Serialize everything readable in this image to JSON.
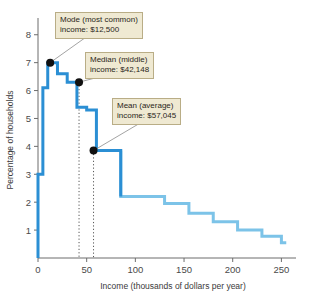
{
  "chart_data": {
    "type": "area",
    "title": "",
    "xlabel": "Income (thousands of dollars per year)",
    "ylabel": "Percentage of households",
    "xlim": [
      0,
      265
    ],
    "ylim": [
      0,
      8.6
    ],
    "xticks": [
      0,
      50,
      100,
      150,
      200,
      250
    ],
    "xtick_labels": [
      "0",
      "50",
      "100",
      "150",
      "200",
      "250"
    ],
    "yticks": [
      1,
      2,
      3,
      4,
      5,
      6,
      7,
      8
    ],
    "ytick_labels": [
      "1",
      "2",
      "3",
      "4",
      "5",
      "6",
      "7",
      "8"
    ],
    "grid": false,
    "legend": "none",
    "bin_width": 5,
    "bin_starts": [
      0,
      5,
      10,
      15,
      20,
      25,
      30,
      35,
      40,
      45,
      50,
      55,
      60,
      65,
      70,
      75,
      80,
      85,
      90,
      95,
      100,
      105,
      110,
      115,
      120,
      125,
      130,
      135,
      140,
      145,
      150,
      155,
      160,
      165,
      170,
      175,
      180,
      185,
      190,
      195,
      200,
      205,
      210,
      215,
      220,
      225,
      230,
      235,
      240,
      245,
      250
    ],
    "values": [
      3.0,
      6.1,
      7.0,
      7.0,
      6.6,
      6.6,
      6.3,
      6.3,
      5.4,
      5.4,
      5.3,
      5.3,
      3.85,
      3.85,
      3.85,
      3.85,
      3.85,
      2.2,
      2.2,
      2.2,
      2.2,
      2.2,
      2.2,
      2.2,
      2.2,
      2.2,
      1.95,
      1.95,
      1.95,
      1.95,
      1.95,
      1.6,
      1.6,
      1.6,
      1.6,
      1.6,
      1.3,
      1.3,
      1.3,
      1.3,
      1.3,
      1.0,
      1.0,
      1.0,
      1.0,
      1.0,
      0.78,
      0.78,
      0.78,
      0.78,
      0.55
    ],
    "markers": [
      {
        "name": "mode",
        "x": 12.5,
        "y": 7.0,
        "label": "Mode (most common)",
        "value_label": "income: $12,500"
      },
      {
        "name": "median",
        "x": 42.148,
        "y": 6.3,
        "label": "Median (middle)",
        "value_label": "income: $42,148"
      },
      {
        "name": "mean",
        "x": 57.045,
        "y": 3.85,
        "label": "Mean (average)",
        "value_label": "income: $57,045"
      }
    ],
    "dropline_x": [
      42.148,
      57.045
    ],
    "colors": {
      "line_dark": "#2b8fd4",
      "line_light": "#7cc3e8",
      "marker": "#111111",
      "axis": "#6d6d6d",
      "callout_bg": "#efe9d2",
      "callout_border": "#b9ad86",
      "leader": "#8c8c8c"
    }
  },
  "callouts": {
    "mode": {
      "line1": "Mode (most common)",
      "line2": "income: $12,500"
    },
    "median": {
      "line1": "Median (middle)",
      "line2": "income: $42,148"
    },
    "mean": {
      "line1": "Mean (average)",
      "line2": "income: $57,045"
    }
  },
  "axes": {
    "x_title": "Income (thousands of dollars per year)",
    "y_title": "Percentage of households"
  }
}
